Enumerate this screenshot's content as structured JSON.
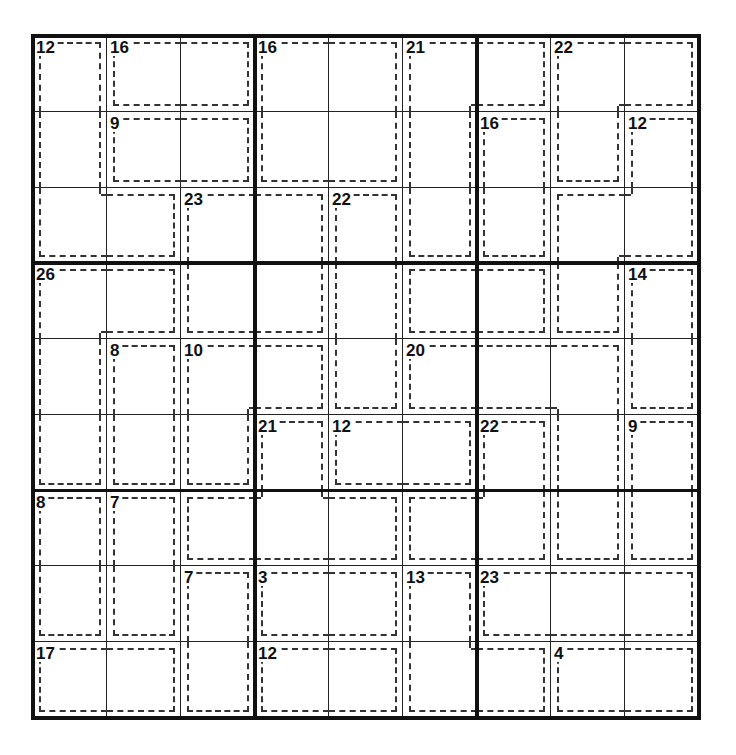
{
  "puzzle": {
    "type": "killer-sudoku",
    "size": 9,
    "cages": [
      {
        "sum": "12",
        "cells": [
          [
            0,
            0
          ],
          [
            1,
            0
          ],
          [
            2,
            0
          ],
          [
            2,
            1
          ]
        ]
      },
      {
        "sum": "16",
        "cells": [
          [
            0,
            1
          ],
          [
            0,
            2
          ]
        ]
      },
      {
        "sum": "16",
        "cells": [
          [
            0,
            3
          ],
          [
            0,
            4
          ],
          [
            1,
            3
          ],
          [
            1,
            4
          ]
        ]
      },
      {
        "sum": "21",
        "cells": [
          [
            0,
            5
          ],
          [
            0,
            6
          ],
          [
            1,
            5
          ],
          [
            2,
            5
          ]
        ]
      },
      {
        "sum": "22",
        "cells": [
          [
            0,
            7
          ],
          [
            0,
            8
          ],
          [
            1,
            7
          ]
        ]
      },
      {
        "sum": "9",
        "cells": [
          [
            1,
            1
          ],
          [
            1,
            2
          ]
        ]
      },
      {
        "sum": "16",
        "cells": [
          [
            1,
            6
          ],
          [
            2,
            6
          ]
        ]
      },
      {
        "sum": "12",
        "cells": [
          [
            1,
            8
          ],
          [
            2,
            7
          ],
          [
            2,
            8
          ],
          [
            3,
            7
          ]
        ]
      },
      {
        "sum": "23",
        "cells": [
          [
            2,
            2
          ],
          [
            2,
            3
          ],
          [
            3,
            2
          ],
          [
            3,
            3
          ]
        ]
      },
      {
        "sum": "22",
        "cells": [
          [
            2,
            4
          ],
          [
            3,
            4
          ],
          [
            4,
            4
          ]
        ]
      },
      {
        "sum": "26",
        "cells": [
          [
            3,
            0
          ],
          [
            3,
            1
          ],
          [
            4,
            0
          ],
          [
            5,
            0
          ]
        ]
      },
      {
        "sum": "",
        "cells": [
          [
            3,
            5
          ],
          [
            3,
            6
          ]
        ]
      },
      {
        "sum": "14",
        "cells": [
          [
            3,
            8
          ],
          [
            4,
            8
          ]
        ]
      },
      {
        "sum": "8",
        "cells": [
          [
            4,
            1
          ],
          [
            5,
            1
          ]
        ]
      },
      {
        "sum": "10",
        "cells": [
          [
            4,
            2
          ],
          [
            4,
            3
          ],
          [
            5,
            2
          ]
        ]
      },
      {
        "sum": "20",
        "cells": [
          [
            4,
            5
          ],
          [
            4,
            6
          ],
          [
            4,
            7
          ],
          [
            5,
            7
          ],
          [
            6,
            7
          ]
        ]
      },
      {
        "sum": "21",
        "cells": [
          [
            5,
            3
          ],
          [
            6,
            2
          ],
          [
            6,
            3
          ],
          [
            6,
            4
          ]
        ]
      },
      {
        "sum": "12",
        "cells": [
          [
            5,
            4
          ],
          [
            5,
            5
          ]
        ]
      },
      {
        "sum": "22",
        "cells": [
          [
            5,
            6
          ],
          [
            6,
            5
          ],
          [
            6,
            6
          ]
        ]
      },
      {
        "sum": "9",
        "cells": [
          [
            5,
            8
          ],
          [
            6,
            8
          ]
        ]
      },
      {
        "sum": "8",
        "cells": [
          [
            6,
            0
          ],
          [
            7,
            0
          ]
        ]
      },
      {
        "sum": "7",
        "cells": [
          [
            6,
            1
          ],
          [
            7,
            1
          ]
        ]
      },
      {
        "sum": "7",
        "cells": [
          [
            7,
            2
          ],
          [
            8,
            2
          ]
        ]
      },
      {
        "sum": "3",
        "cells": [
          [
            7,
            3
          ],
          [
            7,
            4
          ]
        ]
      },
      {
        "sum": "13",
        "cells": [
          [
            7,
            5
          ],
          [
            8,
            5
          ],
          [
            8,
            6
          ]
        ]
      },
      {
        "sum": "23",
        "cells": [
          [
            7,
            6
          ],
          [
            7,
            7
          ],
          [
            7,
            8
          ]
        ]
      },
      {
        "sum": "17",
        "cells": [
          [
            8,
            0
          ],
          [
            8,
            1
          ]
        ]
      },
      {
        "sum": "12",
        "cells": [
          [
            8,
            3
          ],
          [
            8,
            4
          ]
        ]
      },
      {
        "sum": "4",
        "cells": [
          [
            8,
            7
          ],
          [
            8,
            8
          ]
        ]
      }
    ],
    "values": [
      [
        "",
        "",
        "",
        "",
        "",
        "",
        "",
        "",
        ""
      ],
      [
        "",
        "",
        "",
        "",
        "",
        "",
        "",
        "",
        ""
      ],
      [
        "",
        "",
        "",
        "",
        "",
        "",
        "",
        "",
        ""
      ],
      [
        "",
        "",
        "",
        "",
        "",
        "",
        "",
        "",
        ""
      ],
      [
        "",
        "",
        "",
        "",
        "",
        "",
        "",
        "",
        ""
      ],
      [
        "",
        "",
        "",
        "",
        "",
        "",
        "",
        "",
        ""
      ],
      [
        "",
        "",
        "",
        "",
        "",
        "",
        "",
        "",
        ""
      ],
      [
        "",
        "",
        "",
        "",
        "",
        "",
        "",
        "",
        ""
      ],
      [
        "",
        "",
        "",
        "",
        "",
        "",
        "",
        "",
        ""
      ]
    ]
  }
}
